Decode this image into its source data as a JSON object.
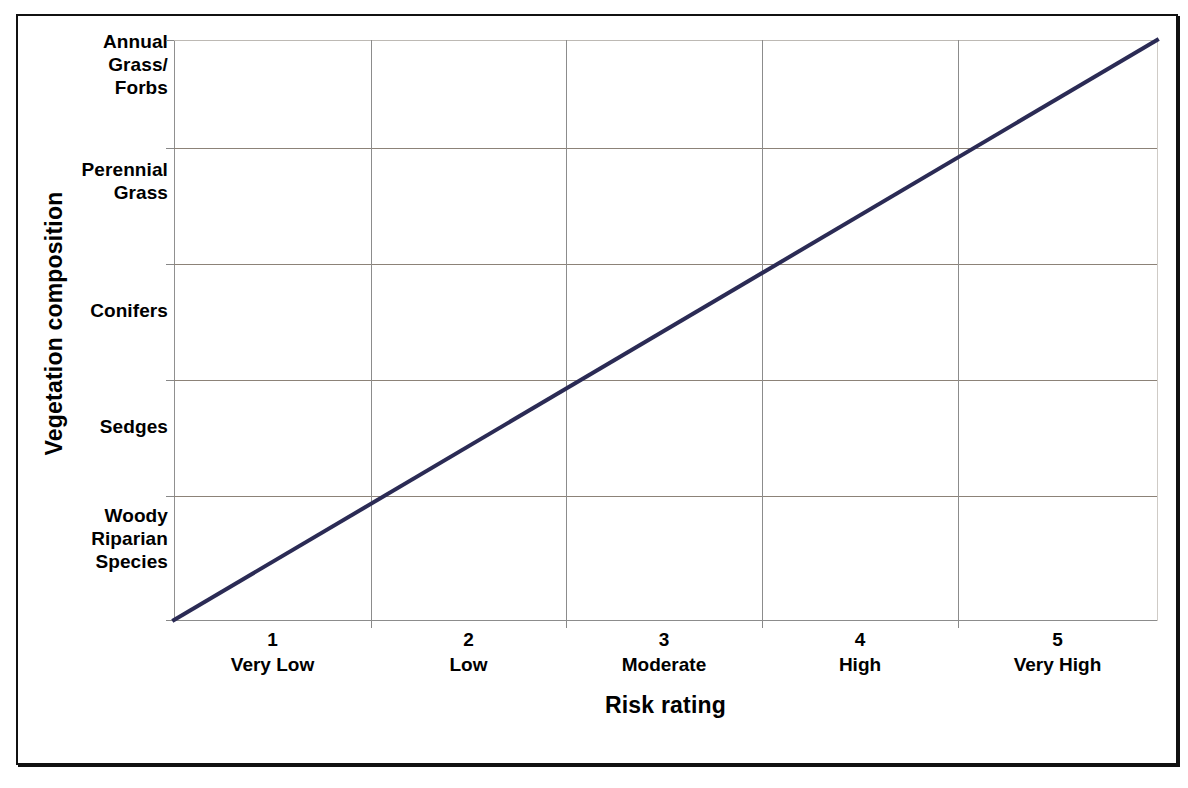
{
  "chart_data": {
    "type": "line",
    "title": "",
    "xlabel": "Risk rating",
    "ylabel": "Vegetation composition",
    "grid": true,
    "legend": "none",
    "x": [
      0.5,
      5.5
    ],
    "xlim": [
      0.5,
      5.5
    ],
    "ylim": [
      0,
      5
    ],
    "x_tick_values": [
      1,
      2,
      3,
      4,
      5
    ],
    "x_tick_labels": [
      "1",
      "2",
      "3",
      "4",
      "5"
    ],
    "x_tick_sublabels": [
      "Very Low",
      "Low",
      "Moderate",
      "High",
      "Very High"
    ],
    "y_tick_labels": [
      "Woody Riparian Species",
      "Sedges",
      "Conifers",
      "Perennial Grass",
      "Annual Grass/ Forbs"
    ],
    "series": [
      {
        "name": "Vegetation composition vs risk rating",
        "color": "#2b2b55",
        "points": [
          {
            "x": 0.5,
            "y": 0.0
          },
          {
            "x": 5.5,
            "y": 5.0
          }
        ],
        "description": "Straight increasing line from bottom-left corner (Woody Riparian Species / below Very Low) to top-right corner (Annual Grass/Forbs / above Very High)"
      }
    ]
  },
  "axes": {
    "y_title": "Vegetation composition",
    "x_title": "Risk rating",
    "y_categories": [
      {
        "lines": [
          "Annual",
          "Grass/",
          "Forbs"
        ]
      },
      {
        "lines": [
          "Perennial",
          "Grass"
        ]
      },
      {
        "lines": [
          "Conifers"
        ]
      },
      {
        "lines": [
          "Sedges"
        ]
      },
      {
        "lines": [
          "Woody",
          "Riparian",
          "Species"
        ]
      }
    ],
    "x_ticks": [
      {
        "number": "1",
        "description": "Very Low"
      },
      {
        "number": "2",
        "description": "Low"
      },
      {
        "number": "3",
        "description": "Moderate"
      },
      {
        "number": "4",
        "description": "High"
      },
      {
        "number": "5",
        "description": "Very High"
      }
    ]
  },
  "style": {
    "line_color": "#2b2b55",
    "grid_color": "#8c8278",
    "axis_color": "#8c8c8c",
    "frame_color": "#111111",
    "text_color": "#000000",
    "background": "#ffffff"
  },
  "caption": ""
}
